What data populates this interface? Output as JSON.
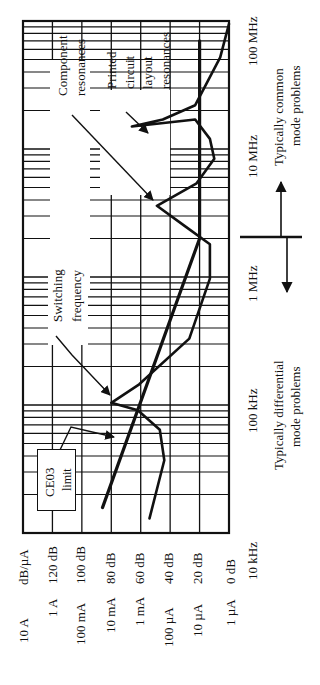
{
  "figure": {
    "orientation": "rotated 90deg counter-clockwise",
    "colors": {
      "ink": "#111111",
      "background": "#ffffff"
    }
  },
  "axes": {
    "frequency_ticks": [
      {
        "label": "10 kHz",
        "log10_hz": 4
      },
      {
        "label": "100 kHz",
        "log10_hz": 5
      },
      {
        "label": "1 MHz",
        "log10_hz": 6
      },
      {
        "label": "10 MHz",
        "log10_hz": 7
      },
      {
        "label": "100 MHz",
        "log10_hz": 8
      }
    ],
    "level_unit_label": "dB/µA",
    "level_ticks": [
      {
        "db_label": "120 dB",
        "current_label": "1 A",
        "db": 120
      },
      {
        "db_label": "100 dB",
        "current_label": "100 mA",
        "db": 100
      },
      {
        "db_label": "80 dB",
        "current_label": "10 mA",
        "db": 80
      },
      {
        "db_label": "60 dB",
        "current_label": "1 mA",
        "db": 60
      },
      {
        "db_label": "40 dB",
        "current_label": "100 µA",
        "db": 40
      },
      {
        "db_label": "20 dB",
        "current_label": "10 µA",
        "db": 20
      },
      {
        "db_label": "0 dB",
        "current_label": "1 µA",
        "db": 0
      }
    ],
    "top_current_label": "10 A"
  },
  "annotations": {
    "component": [
      "Component",
      "resonances"
    ],
    "pcb": [
      "Printed",
      "circuit",
      "layout",
      "resonances"
    ],
    "switching": [
      "Switching",
      "frequency"
    ],
    "ce03": [
      "CE03",
      "limit"
    ],
    "common_mode": [
      "Typically common",
      "mode problems"
    ],
    "differential_mode": [
      "Typically differential",
      "mode problems"
    ]
  },
  "chart_data": {
    "type": "line",
    "title": "",
    "xlabel": "Frequency",
    "ylabel": "dB/µA",
    "x_scale": "log",
    "xlim_hz": [
      10000,
      100000000
    ],
    "ylim_db": [
      0,
      140
    ],
    "grid": true,
    "x_tick_labels": [
      "10 kHz",
      "100 kHz",
      "1 MHz",
      "10 MHz",
      "100 MHz"
    ],
    "y_tick_labels": [
      "120 dB",
      "100 dB",
      "80 dB",
      "60 dB",
      "40 dB",
      "20 dB",
      "0 dB"
    ],
    "y_secondary_tick_labels": [
      "10 A",
      "1 A",
      "100 mA",
      "10 mA",
      "1 mA",
      "100 µA",
      "10 µA",
      "1 µA"
    ],
    "series": [
      {
        "name": "CE03 limit",
        "style": "thick straight",
        "points": [
          {
            "f_hz": 15800,
            "db": 86
          },
          {
            "f_hz": 2000000,
            "db": 20
          },
          {
            "f_hz": 70000000,
            "db": 20
          }
        ]
      },
      {
        "name": "Emission spectrum",
        "style": "thick curve",
        "points": [
          {
            "f_hz": 13000,
            "db": 54
          },
          {
            "f_hz": 37000,
            "db": 44
          },
          {
            "f_hz": 64000,
            "db": 47
          },
          {
            "f_hz": 91000,
            "db": 62
          },
          {
            "f_hz": 104000,
            "db": 80
          },
          {
            "f_hz": 145000,
            "db": 61
          },
          {
            "f_hz": 330000,
            "db": 27
          },
          {
            "f_hz": 970000,
            "db": 13
          },
          {
            "f_hz": 1800000,
            "db": 13
          },
          {
            "f_hz": 2500000,
            "db": 30
          },
          {
            "f_hz": 3600000,
            "db": 49
          },
          {
            "f_hz": 5400000,
            "db": 22
          },
          {
            "f_hz": 8400000,
            "db": 10
          },
          {
            "f_hz": 12000000,
            "db": 13
          },
          {
            "f_hz": 17000000,
            "db": 23
          },
          {
            "f_hz": 15000000,
            "db": 66
          },
          {
            "f_hz": 17000000,
            "db": 45
          },
          {
            "f_hz": 22000000,
            "db": 23
          },
          {
            "f_hz": 52000000,
            "db": 6
          },
          {
            "f_hz": 95000000,
            "db": 0
          }
        ]
      }
    ],
    "annotations": [
      {
        "text": "Switching frequency",
        "points_to_f_hz": 104000,
        "points_to_db": 80
      },
      {
        "text": "Component resonances",
        "points_to_f_hz": 3600000,
        "points_to_db": 49
      },
      {
        "text": "Printed circuit layout resonances",
        "points_to_f_hz": 15000000,
        "points_to_db": 66
      },
      {
        "text": "CE03 limit",
        "points_to_f_hz": 40000,
        "points_to_db": 80
      },
      {
        "text": "Typically common mode problems",
        "region": "above ~2 MHz"
      },
      {
        "text": "Typically differential mode problems",
        "region": "below ~2 MHz"
      }
    ]
  }
}
